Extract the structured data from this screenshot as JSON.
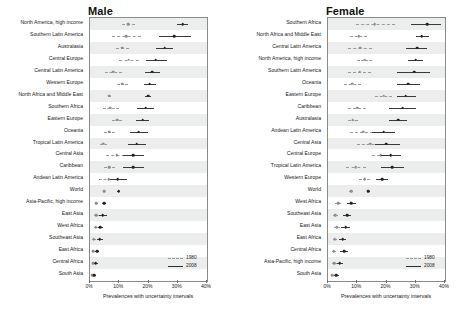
{
  "figure": {
    "axis_title": "Prevalences with uncertainty intervals",
    "legend": [
      {
        "key": "y1980",
        "label": "1980",
        "style": "dashed",
        "color": "#9a9a9a"
      },
      {
        "key": "y2008",
        "label": "2008",
        "style": "solid",
        "color": "#2e2e2e"
      }
    ]
  },
  "chart_data": [
    {
      "type": "scatter",
      "title": "Male",
      "xlabel": "Prevalences with uncertainty intervals",
      "ylabel": "",
      "xlim": [
        0,
        40
      ],
      "xticks": [
        0,
        10,
        20,
        30,
        40
      ],
      "xticklabels": [
        "0%",
        "10%",
        "20%",
        "30%",
        "40%"
      ],
      "grid": false,
      "legend_position": "bottom-right",
      "series": [
        "1980",
        "2008"
      ],
      "categories": [
        "North America, high income",
        "Southern Latin America",
        "Australasia",
        "Central Europe",
        "Central Latin America",
        "Western Europe",
        "North Africa and Middle East",
        "Southern Africa",
        "Eastern Europe",
        "Oceania",
        "Tropical Latin America",
        "Central Asia",
        "Caribbean",
        "Andean Latin America",
        "World",
        "Asia-Pacific, high income",
        "East Asia",
        "West Africa",
        "Southeast Asia",
        "East Africa",
        "Central Africa",
        "South Asia"
      ],
      "points": [
        {
          "category": "North America, high income",
          "y1980": {
            "value": 13.0,
            "low": 11.0,
            "high": 15.3
          },
          "y2008": {
            "value": 31.7,
            "low": 29.8,
            "high": 33.6
          }
        },
        {
          "category": "Southern Latin America",
          "y1980": {
            "value": 12.4,
            "low": 7.6,
            "high": 17.6
          },
          "y2008": {
            "value": 28.8,
            "low": 23.5,
            "high": 34.4
          }
        },
        {
          "category": "Australasia",
          "y1980": {
            "value": 11.1,
            "low": 9.0,
            "high": 13.4
          },
          "y2008": {
            "value": 25.5,
            "low": 22.7,
            "high": 28.5
          }
        },
        {
          "category": "Central Europe",
          "y1980": {
            "value": 13.2,
            "low": 10.0,
            "high": 16.6
          },
          "y2008": {
            "value": 22.5,
            "low": 19.1,
            "high": 26.2
          }
        },
        {
          "category": "Central Latin America",
          "y1980": {
            "value": 8.0,
            "low": 5.2,
            "high": 11.1
          },
          "y2008": {
            "value": 21.3,
            "low": 18.9,
            "high": 23.9
          }
        },
        {
          "category": "Western Europe",
          "y1980": {
            "value": 11.0,
            "low": 9.2,
            "high": 12.9
          },
          "y2008": {
            "value": 20.4,
            "low": 18.5,
            "high": 22.4
          }
        },
        {
          "category": "North Africa and Middle East",
          "y1980": {
            "value": 6.6,
            "low": 6.0,
            "high": 7.3
          },
          "y2008": {
            "value": 19.9,
            "low": 18.8,
            "high": 21.0
          }
        },
        {
          "category": "Southern Africa",
          "y1980": {
            "value": 7.0,
            "low": 4.4,
            "high": 9.8
          },
          "y2008": {
            "value": 19.0,
            "low": 16.2,
            "high": 22.0
          }
        },
        {
          "category": "Eastern Europe",
          "y1980": {
            "value": 9.3,
            "low": 7.6,
            "high": 11.1
          },
          "y2008": {
            "value": 18.0,
            "low": 15.8,
            "high": 20.3
          }
        },
        {
          "category": "Oceania",
          "y1980": {
            "value": 6.6,
            "low": 4.7,
            "high": 8.7
          },
          "y2008": {
            "value": 16.6,
            "low": 13.6,
            "high": 19.8
          }
        },
        {
          "category": "Tropical Latin America",
          "y1980": {
            "value": 4.6,
            "low": 3.4,
            "high": 5.9
          },
          "y2008": {
            "value": 16.0,
            "low": 13.0,
            "high": 19.3
          }
        },
        {
          "category": "Central Asia",
          "y1980": {
            "value": 9.2,
            "low": 5.3,
            "high": 13.6
          },
          "y2008": {
            "value": 14.8,
            "low": 11.3,
            "high": 18.5
          }
        },
        {
          "category": "Caribbean",
          "y1980": {
            "value": 6.5,
            "low": 4.7,
            "high": 8.4
          },
          "y2008": {
            "value": 14.7,
            "low": 11.3,
            "high": 18.4
          }
        },
        {
          "category": "Andean Latin America",
          "y1980": {
            "value": 6.4,
            "low": 3.2,
            "high": 10.1
          },
          "y2008": {
            "value": 9.5,
            "low": 6.7,
            "high": 12.6
          }
        },
        {
          "category": "World",
          "y1980": {
            "value": 4.8,
            "low": 4.4,
            "high": 5.2
          },
          "y2008": {
            "value": 9.8,
            "low": 9.3,
            "high": 10.3
          }
        },
        {
          "category": "Asia-Pacific, high income",
          "y1980": {
            "value": 2.2,
            "low": 1.6,
            "high": 2.8
          },
          "y2008": {
            "value": 4.8,
            "low": 4.0,
            "high": 5.6
          }
        },
        {
          "category": "East Asia",
          "y1980": {
            "value": 2.1,
            "low": 1.2,
            "high": 3.2
          },
          "y2008": {
            "value": 4.4,
            "low": 3.1,
            "high": 5.9
          }
        },
        {
          "category": "West Africa",
          "y1980": {
            "value": 1.9,
            "low": 1.3,
            "high": 2.6
          },
          "y2008": {
            "value": 3.5,
            "low": 2.7,
            "high": 4.4
          }
        },
        {
          "category": "Southeast Asia",
          "y1980": {
            "value": 1.3,
            "low": 0.8,
            "high": 1.9
          },
          "y2008": {
            "value": 3.3,
            "low": 2.4,
            "high": 4.3
          }
        },
        {
          "category": "East Africa",
          "y1980": {
            "value": 1.2,
            "low": 0.8,
            "high": 1.7
          },
          "y2008": {
            "value": 2.4,
            "low": 1.7,
            "high": 3.2
          }
        },
        {
          "category": "Central Africa",
          "y1980": {
            "value": 1.1,
            "low": 0.7,
            "high": 1.6
          },
          "y2008": {
            "value": 2.0,
            "low": 1.4,
            "high": 2.7
          }
        },
        {
          "category": "South Asia",
          "y1980": {
            "value": 0.7,
            "low": 0.5,
            "high": 1.0
          },
          "y2008": {
            "value": 1.5,
            "low": 1.1,
            "high": 2.0
          }
        }
      ]
    },
    {
      "type": "scatter",
      "title": "Female",
      "xlabel": "Prevalences with uncertainty intervals",
      "ylabel": "",
      "xlim": [
        0,
        40
      ],
      "xticks": [
        0,
        10,
        20,
        30,
        40
      ],
      "xticklabels": [
        "0%",
        "10%",
        "20%",
        "30%",
        "40%"
      ],
      "grid": false,
      "legend_position": "bottom-right",
      "series": [
        "1980",
        "2008"
      ],
      "categories": [
        "Southern Africa",
        "North Africa and Middle East",
        "Central Latin America",
        "North America, high income",
        "Southern Latin America",
        "Oceania",
        "Eastern Europe",
        "Caribbean",
        "Australasia",
        "Andean Latin America",
        "Central Asia",
        "Central Europe",
        "Tropical Latin America",
        "Western Europe",
        "World",
        "West Africa",
        "Southeast Asia",
        "East Asia",
        "East Africa",
        "Central Africa",
        "Asia-Pacific, high income",
        "South Asia"
      ],
      "points": [
        {
          "category": "Southern Africa",
          "y1980": {
            "value": 16.0,
            "low": 9.5,
            "high": 23.0
          },
          "y2008": {
            "value": 34.0,
            "low": 28.5,
            "high": 38.5
          }
        },
        {
          "category": "North Africa and Middle East",
          "y1980": {
            "value": 10.5,
            "low": 7.5,
            "high": 13.5
          },
          "y2008": {
            "value": 32.0,
            "low": 30.0,
            "high": 34.5
          }
        },
        {
          "category": "Central Latin America",
          "y1980": {
            "value": 11.0,
            "low": 7.0,
            "high": 15.2
          },
          "y2008": {
            "value": 30.5,
            "low": 26.8,
            "high": 34.0
          }
        },
        {
          "category": "North America, high income",
          "y1980": {
            "value": 12.5,
            "low": 10.0,
            "high": 15.0
          },
          "y2008": {
            "value": 30.0,
            "low": 27.5,
            "high": 32.5
          }
        },
        {
          "category": "Southern Latin America",
          "y1980": {
            "value": 10.8,
            "low": 6.8,
            "high": 14.8
          },
          "y2008": {
            "value": 29.5,
            "low": 23.5,
            "high": 35.0
          }
        },
        {
          "category": "Oceania",
          "y1980": {
            "value": 8.2,
            "low": 5.5,
            "high": 11.2
          },
          "y2008": {
            "value": 27.5,
            "low": 23.5,
            "high": 31.5
          }
        },
        {
          "category": "Eastern Europe",
          "y1980": {
            "value": 19.0,
            "low": 16.0,
            "high": 22.0
          },
          "y2008": {
            "value": 26.5,
            "low": 23.5,
            "high": 30.0
          }
        },
        {
          "category": "Caribbean",
          "y1980": {
            "value": 10.0,
            "low": 7.0,
            "high": 13.0
          },
          "y2008": {
            "value": 25.5,
            "low": 21.0,
            "high": 30.0
          }
        },
        {
          "category": "Australasia",
          "y1980": {
            "value": 8.5,
            "low": 6.8,
            "high": 10.2
          },
          "y2008": {
            "value": 24.0,
            "low": 21.0,
            "high": 27.0
          }
        },
        {
          "category": "Andean Latin America",
          "y1980": {
            "value": 12.0,
            "low": 7.5,
            "high": 17.0
          },
          "y2008": {
            "value": 19.0,
            "low": 15.0,
            "high": 23.0
          }
        },
        {
          "category": "Central Asia",
          "y1980": {
            "value": 14.5,
            "low": 10.0,
            "high": 19.0
          },
          "y2008": {
            "value": 20.0,
            "low": 16.0,
            "high": 24.5
          }
        },
        {
          "category": "Central Europe",
          "y1980": {
            "value": 18.0,
            "low": 15.0,
            "high": 21.5
          },
          "y2008": {
            "value": 21.5,
            "low": 18.0,
            "high": 25.0
          }
        },
        {
          "category": "Tropical Latin America",
          "y1980": {
            "value": 9.5,
            "low": 6.0,
            "high": 13.0
          },
          "y2008": {
            "value": 22.0,
            "low": 18.0,
            "high": 26.0
          }
        },
        {
          "category": "Western Europe",
          "y1980": {
            "value": 12.5,
            "low": 10.5,
            "high": 14.5
          },
          "y2008": {
            "value": 18.5,
            "low": 16.5,
            "high": 20.5
          }
        },
        {
          "category": "World",
          "y1980": {
            "value": 7.9,
            "low": 7.2,
            "high": 8.6
          },
          "y2008": {
            "value": 13.8,
            "low": 13.2,
            "high": 14.4
          }
        },
        {
          "category": "West Africa",
          "y1980": {
            "value": 3.4,
            "low": 2.4,
            "high": 4.5
          },
          "y2008": {
            "value": 8.0,
            "low": 6.5,
            "high": 9.5
          }
        },
        {
          "category": "Southeast Asia",
          "y1980": {
            "value": 2.5,
            "low": 1.7,
            "high": 3.4
          },
          "y2008": {
            "value": 6.5,
            "low": 5.2,
            "high": 7.9
          }
        },
        {
          "category": "East Asia",
          "y1980": {
            "value": 3.0,
            "low": 2.0,
            "high": 4.2
          },
          "y2008": {
            "value": 6.0,
            "low": 4.6,
            "high": 7.6
          }
        },
        {
          "category": "East Africa",
          "y1980": {
            "value": 2.3,
            "low": 1.6,
            "high": 3.1
          },
          "y2008": {
            "value": 5.0,
            "low": 3.9,
            "high": 6.2
          }
        },
        {
          "category": "Central Africa",
          "y1980": {
            "value": 2.0,
            "low": 1.3,
            "high": 2.8
          },
          "y2008": {
            "value": 5.5,
            "low": 4.2,
            "high": 7.0
          }
        },
        {
          "category": "Asia-Pacific, high income",
          "y1980": {
            "value": 2.2,
            "low": 1.5,
            "high": 3.0
          },
          "y2008": {
            "value": 4.0,
            "low": 3.1,
            "high": 5.0
          }
        },
        {
          "category": "South Asia",
          "y1980": {
            "value": 1.5,
            "low": 1.0,
            "high": 2.1
          },
          "y2008": {
            "value": 2.8,
            "low": 2.1,
            "high": 3.6
          }
        }
      ]
    }
  ]
}
